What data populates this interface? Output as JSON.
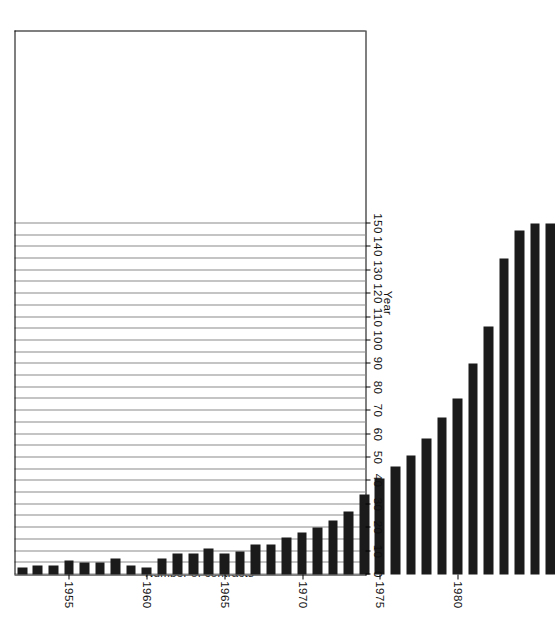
{
  "chart_data": {
    "type": "bar",
    "orientation": "horizontal-rotated",
    "title": "",
    "xlabel": "Year",
    "ylabel": "Number of contracts",
    "ylim": [
      0,
      150
    ],
    "ytick_labels": [
      "0",
      "10",
      "20",
      "30",
      "40",
      "50",
      "60",
      "70",
      "80",
      "90",
      "100",
      "110",
      "120",
      "130",
      "140",
      "150"
    ],
    "ytick_values": [
      0,
      10,
      20,
      30,
      40,
      50,
      60,
      70,
      80,
      90,
      100,
      110,
      120,
      130,
      140,
      150
    ],
    "xtick_labels": [
      "1955",
      "1960",
      "1965",
      "1970",
      "1975",
      "1980",
      "1990"
    ],
    "xtick_values": [
      1955,
      1960,
      1965,
      1970,
      1975,
      1980,
      1990
    ],
    "xlim": [
      1951.5,
      1986.5
    ],
    "grid": true,
    "grid_axis": "y",
    "grid_step": 5,
    "bar_color": "#1b1b1b",
    "categories": [
      1952,
      1953,
      1954,
      1955,
      1956,
      1957,
      1958,
      1959,
      1960,
      1961,
      1962,
      1963,
      1964,
      1965,
      1966,
      1967,
      1968,
      1969,
      1970,
      1971,
      1972,
      1973,
      1974,
      1975,
      1976,
      1977,
      1978,
      1979,
      1980,
      1981,
      1982,
      1983,
      1984,
      1985,
      1986
    ],
    "values": [
      3,
      4,
      4,
      6,
      5,
      5,
      7,
      4,
      3,
      7,
      9,
      9,
      11,
      9,
      10,
      13,
      13,
      16,
      18,
      20,
      23,
      27,
      34,
      41,
      46,
      51,
      58,
      67,
      75,
      90,
      106,
      135,
      147,
      150,
      150
    ]
  },
  "axes": {
    "value_axis_title": "Number of contracts",
    "category_axis_title": "Year"
  }
}
